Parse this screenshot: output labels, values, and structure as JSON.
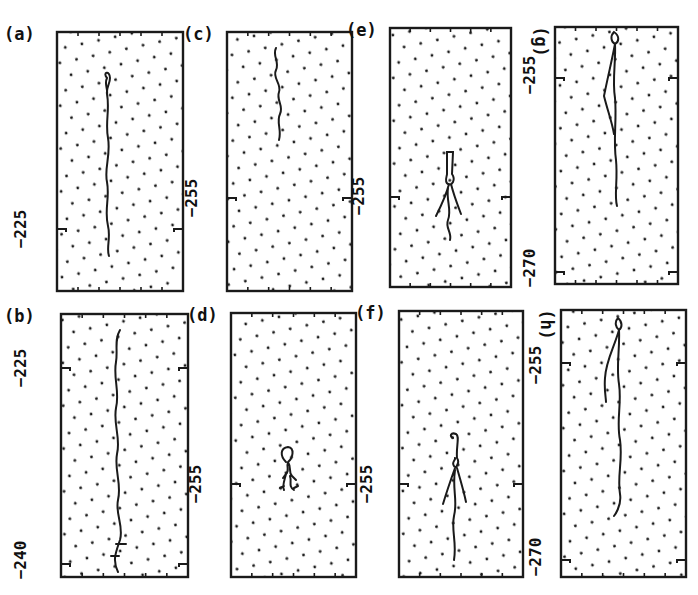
{
  "figure": {
    "panels": [
      {
        "id": "a",
        "label": "(a)",
        "box": [
          57,
          32,
          183,
          291
        ],
        "ticks": [
          {
            "label": "-225",
            "y": 229
          }
        ],
        "trace": "M107,78 C102,72 110,70 110,78 C110,84 106,88 107,94 C110,110 105,122 108,138 C111,155 104,168 107,182 C110,198 104,210 108,226 C111,238 106,248 109,256 M107,78 C104,84 108,88 107,94"
      },
      {
        "id": "b",
        "label": "(b)",
        "box": [
          61,
          314,
          188,
          577
        ],
        "ticks": [
          {
            "label": "-225",
            "y": 368
          },
          {
            "label": "-240",
            "y": 564
          }
        ],
        "trace": "M120,330 C114,340 118,350 116,362 C113,378 120,392 116,408 C113,424 121,438 117,454 C114,470 122,484 118,500 C115,514 124,526 120,540 C116,552 112,560 118,572 M116,544 L126,544 M111,556 L119,556"
      },
      {
        "id": "c",
        "label": "(c)",
        "box": [
          227,
          32,
          352,
          291
        ],
        "ticks": [
          {
            "label": "-255",
            "y": 198
          }
        ],
        "trace": "M276,48 C272,56 280,62 276,70 C272,78 282,84 279,92 C276,100 284,106 280,114 C276,122 282,130 279,140"
      },
      {
        "id": "d",
        "label": "(d)",
        "box": [
          231,
          313,
          356,
          577
        ],
        "ticks": [
          {
            "label": "-255",
            "y": 484
          }
        ],
        "trace": "M286,462 C280,456 280,448 288,447 C295,448 293,458 288,462 C286,468 290,470 286,474 L283,478 M288,462 C292,468 288,472 292,476 L296,480 M286,474 C284,482 282,486 284,490 M290,476 C292,482 288,486 294,490 M284,486 L280,488 M294,488 L298,486"
      },
      {
        "id": "e",
        "label": "(e)",
        "box": [
          390,
          28,
          511,
          287
        ],
        "ticks": [
          {
            "label": "-255",
            "y": 197
          }
        ],
        "trace": "M447,152 L453,152 L452,174 C456,180 452,186 448,184 C444,182 447,176 447,174 Z M449,184 C446,196 440,208 436,216 M451,184 C454,196 458,206 461,214 M448,188 C446,200 452,210 448,220 C445,228 452,232 450,240"
      },
      {
        "id": "f",
        "label": "(f)",
        "box": [
          399,
          311,
          523,
          577
        ],
        "ticks": [
          {
            "label": "-255",
            "y": 484
          }
        ],
        "trace": "M453,438 C449,436 451,432 456,434 C460,436 456,446 457,458 C460,462 456,470 454,466 C451,462 456,460 455,458 M455,468 C450,482 446,494 443,504 M457,468 C461,482 464,492 466,502 M455,470 C452,490 458,500 454,516 C451,530 457,542 454,560"
      },
      {
        "id": "g",
        "label": "(g)",
        "box": [
          555,
          27,
          678,
          284
        ],
        "ticks": [
          {
            "label": "-255",
            "y": 78
          },
          {
            "label": "-270",
            "y": 272
          }
        ],
        "trace": "M614,32 C610,36 611,42 615,44 C619,42 620,36 614,32 Z M615,44 C612,60 608,76 604,96 C608,112 612,122 614,134 M615,44 C616,62 612,80 615,98 C617,120 613,140 616,160 C618,180 614,196 617,206"
      },
      {
        "id": "h",
        "label": "(h)",
        "box": [
          561,
          310,
          686,
          577
        ],
        "ticks": [
          {
            "label": "-255",
            "y": 363
          },
          {
            "label": "-270",
            "y": 560
          }
        ],
        "trace": "M618,318 C614,322 616,328 619,330 C622,328 623,322 618,318 Z M619,330 C614,348 606,360 605,378 C604,390 606,398 606,402 M619,330 C620,350 616,366 619,384 C622,404 616,420 620,440 C623,460 617,476 620,494 C622,506 614,516 614,516"
      }
    ],
    "ylabels": [
      {
        "panel": "a",
        "text": "-225",
        "x": 22,
        "y": 229
      },
      {
        "panel": "b",
        "text": "-225",
        "x": 22,
        "y": 368
      },
      {
        "panel": "b",
        "text": "-240",
        "x": 22,
        "y": 560
      },
      {
        "panel": "c",
        "text": "-255",
        "x": 193,
        "y": 198
      },
      {
        "panel": "d",
        "text": "-255",
        "x": 197,
        "y": 484
      },
      {
        "panel": "e",
        "text": "-255",
        "x": 360,
        "y": 196
      },
      {
        "panel": "f",
        "text": "-255",
        "x": 368,
        "y": 484
      },
      {
        "panel": "g",
        "text": "-255",
        "x": 531,
        "y": 75
      },
      {
        "panel": "g",
        "text": "-270",
        "x": 531,
        "y": 268
      },
      {
        "panel": "h",
        "text": "-255",
        "x": 537,
        "y": 365
      },
      {
        "panel": "h",
        "text": "-270",
        "x": 537,
        "y": 557
      }
    ],
    "colors": {
      "ink": "#1a1a1a",
      "background": "#ffffff"
    }
  }
}
